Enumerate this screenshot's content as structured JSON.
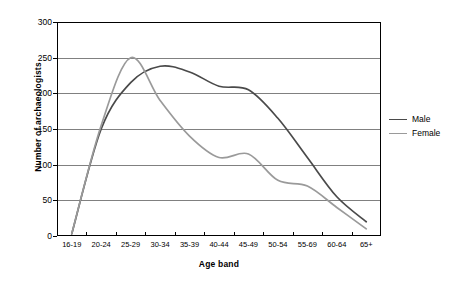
{
  "chart_data": {
    "type": "line",
    "title": "",
    "xlabel": "Age band",
    "ylabel": "Number of archaeologists",
    "categories": [
      "16-19",
      "20-24",
      "25-29",
      "30-34",
      "35-39",
      "40-44",
      "45-49",
      "50-54",
      "55-69",
      "60-64",
      "65+"
    ],
    "series": [
      {
        "name": "Male",
        "color": "#4a4a4a",
        "values": [
          3,
          150,
          215,
          238,
          230,
          210,
          205,
          165,
          110,
          55,
          20
        ]
      },
      {
        "name": "Female",
        "color": "#9a9a9a",
        "values": [
          3,
          155,
          250,
          190,
          140,
          110,
          115,
          78,
          70,
          40,
          10
        ]
      }
    ],
    "ylim": [
      0,
      300
    ],
    "ytick_values": [
      0,
      50,
      100,
      150,
      200,
      250,
      300
    ],
    "ytick_labels": [
      "0",
      "50",
      "100",
      "150",
      "200",
      "250",
      "300"
    ],
    "grid": "horizontal",
    "legend_position": "right",
    "smoothed": true
  },
  "axes": {
    "y_title": "Number of archaeologists",
    "x_title": "Age band"
  },
  "legend": {
    "entries": [
      {
        "label": "Male",
        "color": "#4a4a4a"
      },
      {
        "label": "Female",
        "color": "#9a9a9a"
      }
    ]
  },
  "style": {
    "plot_border_color": "#000000",
    "gridline_color": "#808080",
    "background": "#ffffff"
  }
}
